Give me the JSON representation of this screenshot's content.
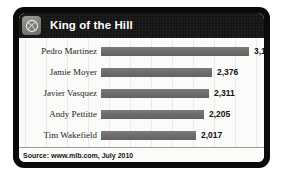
{
  "card": {
    "header": {
      "icon": "baseball-icon",
      "title": "King of the Hill"
    },
    "footer": {
      "source": "Source: www.mlb.com, July 2010"
    }
  },
  "chart_data": {
    "type": "bar",
    "orientation": "horizontal",
    "title": "King of the Hill",
    "xlabel": "",
    "ylabel": "",
    "grid": true,
    "legend": false,
    "xlim": [
      0,
      3154
    ],
    "categories": [
      "Pedro Martinez",
      "Jamie Moyer",
      "Javier Vasquez",
      "Andy Pettitte",
      "Tim Wakefield"
    ],
    "values": [
      3154,
      2376,
      2311,
      2205,
      2017
    ],
    "value_labels": [
      "3,154",
      "2,376",
      "2,311",
      "2,205",
      "2,017"
    ],
    "source": "Source: www.mlb.com, July 2010",
    "bar_color": "#6e6e6e",
    "background_color": "#fbfbf9",
    "header_color": "#141414"
  }
}
